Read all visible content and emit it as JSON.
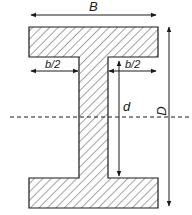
{
  "figure": {
    "labels": {
      "overall_width": "B",
      "left_half_flange": "b/2",
      "right_half_flange": "b/2",
      "web_depth": "d",
      "overall_depth": "D"
    },
    "colors": {
      "stroke": "#1a1a1a",
      "background": "#ffffff"
    }
  }
}
